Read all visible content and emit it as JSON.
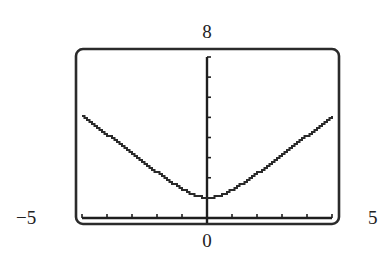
{
  "chart_data": {
    "type": "line",
    "title": "",
    "xlabel": "",
    "ylabel": "",
    "xlim": [
      -5,
      5
    ],
    "ylim": [
      0,
      8
    ],
    "x_tick_step": 1,
    "y_tick_step": 1,
    "grid": false,
    "legend": null,
    "window_labels": {
      "xmin": "−5",
      "xmax": "5",
      "ymax": "8",
      "origin": "0"
    },
    "series": [
      {
        "name": "y = sqrt(x^2 + 1)",
        "x": [
          -5,
          -4.5,
          -4,
          -3.5,
          -3,
          -2.5,
          -2,
          -1.5,
          -1,
          -0.5,
          0,
          0.5,
          1,
          1.5,
          2,
          2.5,
          3,
          3.5,
          4,
          4.5,
          5
        ],
        "values": [
          5.1,
          4.61,
          4.12,
          3.64,
          3.16,
          2.69,
          2.24,
          1.8,
          1.41,
          1.12,
          1.0,
          1.12,
          1.41,
          1.8,
          2.24,
          2.69,
          3.16,
          3.64,
          4.12,
          4.61,
          5.1
        ]
      }
    ]
  },
  "frame": {
    "left": 76,
    "top": 49,
    "right": 339,
    "bottom": 224,
    "radius": 7,
    "color": "#2b2b2b"
  },
  "axes": {
    "origin_px": [
      207,
      218
    ],
    "x_px_range": [
      82,
      332
    ],
    "y_px_top": 57,
    "color": "#1e1e1e"
  },
  "curve_color": "#2a2a2a"
}
